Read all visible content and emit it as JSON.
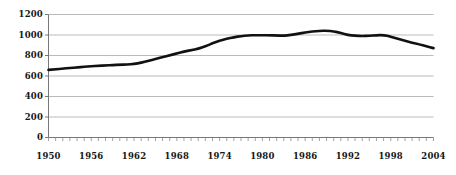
{
  "chart_data": {
    "type": "line",
    "title": "",
    "subtitle": "",
    "xlabel": "",
    "ylabel": "",
    "xlim": [
      1950,
      2004
    ],
    "ylim": [
      0,
      1200
    ],
    "grid": true,
    "legend": false,
    "legend_position": "none",
    "line_color": "#111111",
    "grid_color": "#b3b3b3",
    "axis_color": "#8a8a8a",
    "y_ticks": [
      0,
      200,
      400,
      600,
      800,
      1000,
      1200
    ],
    "y_tick_labels": [
      "0",
      "200",
      "400",
      "600",
      "800",
      "1000",
      "1200"
    ],
    "x_tick_labels": [
      "1950",
      "1956",
      "1962",
      "1968",
      "1974",
      "1980",
      "1986",
      "1992",
      "1998",
      "2004"
    ],
    "x_tick_label_years": [
      1950,
      1956,
      1962,
      1968,
      1974,
      1980,
      1986,
      1992,
      1998,
      2004
    ],
    "x_minor_tick_step": 1,
    "x": [
      1950,
      1951,
      1952,
      1953,
      1954,
      1955,
      1956,
      1957,
      1958,
      1959,
      1960,
      1961,
      1962,
      1963,
      1964,
      1965,
      1966,
      1967,
      1968,
      1969,
      1970,
      1971,
      1972,
      1973,
      1974,
      1975,
      1976,
      1977,
      1978,
      1979,
      1980,
      1981,
      1982,
      1983,
      1984,
      1985,
      1986,
      1987,
      1988,
      1989,
      1990,
      1991,
      1992,
      1993,
      1994,
      1995,
      1996,
      1997,
      1998,
      1999,
      2000,
      2001,
      2002,
      2003,
      2004
    ],
    "values": [
      660,
      666,
      672,
      678,
      684,
      690,
      695,
      699,
      703,
      707,
      710,
      712,
      716,
      730,
      748,
      766,
      784,
      802,
      820,
      838,
      852,
      866,
      890,
      918,
      944,
      962,
      978,
      990,
      996,
      998,
      998,
      997,
      995,
      993,
      1000,
      1012,
      1024,
      1034,
      1040,
      1042,
      1036,
      1020,
      1000,
      992,
      990,
      992,
      998,
      1000,
      984,
      962,
      944,
      926,
      910,
      890,
      872
    ],
    "series": [
      {
        "name": "series-1",
        "color": "#111111",
        "values": [
          660,
          666,
          672,
          678,
          684,
          690,
          695,
          699,
          703,
          707,
          710,
          712,
          716,
          730,
          748,
          766,
          784,
          802,
          820,
          838,
          852,
          866,
          890,
          918,
          944,
          962,
          978,
          990,
          996,
          998,
          998,
          997,
          995,
          993,
          1000,
          1012,
          1024,
          1034,
          1040,
          1042,
          1036,
          1020,
          1000,
          992,
          990,
          992,
          998,
          1000,
          984,
          962,
          944,
          926,
          910,
          890,
          872
        ]
      }
    ],
    "annotations": []
  }
}
